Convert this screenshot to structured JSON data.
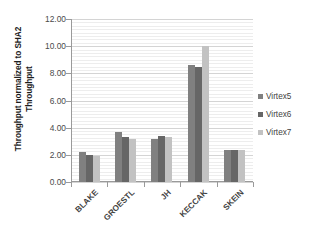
{
  "chart_data": {
    "type": "bar",
    "title": "",
    "xlabel": "",
    "ylabel_line1": "Throughput normalized to SHA2",
    "ylabel_line2": "Throughput",
    "categories": [
      "BLAKE",
      "GROESTL",
      "JH",
      "KECCAK",
      "SKEIN"
    ],
    "series": [
      {
        "name": "Virtex5",
        "color": "#808080",
        "values": [
          2.2,
          3.7,
          3.15,
          8.65,
          2.35
        ]
      },
      {
        "name": "Virtex6",
        "color": "#666666",
        "values": [
          2.0,
          3.35,
          3.4,
          8.5,
          2.35
        ]
      },
      {
        "name": "Virtex7",
        "color": "#c2c2c2",
        "values": [
          1.95,
          3.15,
          3.3,
          10.0,
          2.35
        ]
      }
    ],
    "ylim": [
      0,
      12
    ],
    "ytick_values": [
      0,
      2,
      4,
      6,
      8,
      10,
      12
    ],
    "ytick_labels": [
      "0.00",
      "2.00",
      "4.00",
      "6.00",
      "8.00",
      "10.00",
      "12.00"
    ],
    "ymajor_step": 2,
    "yminor_step": 0.25,
    "grid": true,
    "legend_position": "right",
    "legend_entries": [
      "Virtex5",
      "Virtex6",
      "Virtex7"
    ]
  }
}
